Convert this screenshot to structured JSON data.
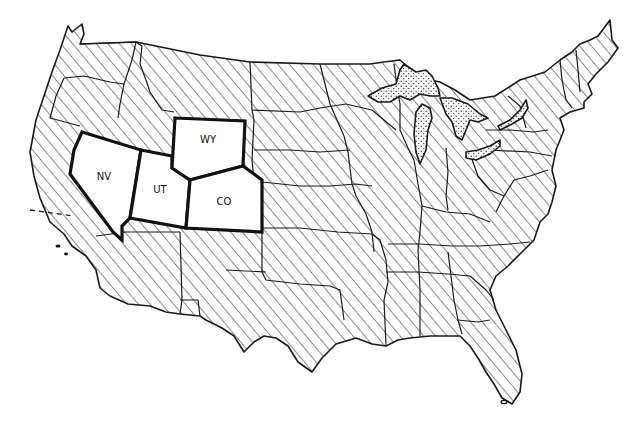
{
  "map": {
    "type": "outline map of the contiguous United States",
    "background_color": "#ffffff",
    "line_color": "#1a1a1a",
    "fill_styles": {
      "other_states": "diagonal-hatch",
      "highlighted_states": "white",
      "great_lakes": "stipple"
    },
    "highlighted_states": [
      {
        "abbr": "NV",
        "label": "NV"
      },
      {
        "abbr": "UT",
        "label": "UT"
      },
      {
        "abbr": "WY",
        "label": "WY"
      },
      {
        "abbr": "CO",
        "label": "CO"
      }
    ]
  }
}
